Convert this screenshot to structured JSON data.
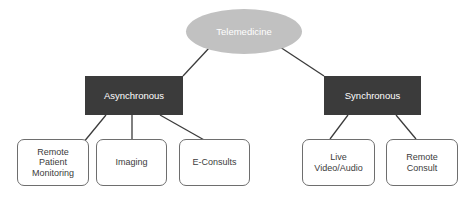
{
  "diagram": {
    "type": "hierarchy-tree",
    "title": "Telemedicine",
    "background_color": "#ffffff",
    "colors": {
      "root_fill": "#c1c1c1",
      "root_text": "#ffffff",
      "category_fill": "#3b3b3b",
      "category_text": "#ffffff",
      "leaf_fill": "#ffffff",
      "leaf_border": "#6e6e6e",
      "leaf_text": "#3c3c3c",
      "connector": "#3b3b3b"
    },
    "root": {
      "label": "Telemedicine",
      "shape": "ellipse"
    },
    "categories": [
      {
        "id": "asynchronous",
        "label": "Asynchronous",
        "shape": "rectangle",
        "children": [
          {
            "id": "remote-patient-monitoring",
            "label": "Remote\nPatient\nMonitoring"
          },
          {
            "id": "imaging",
            "label": "Imaging"
          },
          {
            "id": "e-consults",
            "label": "E-Consults"
          }
        ]
      },
      {
        "id": "synchronous",
        "label": "Synchronous",
        "shape": "rectangle",
        "children": [
          {
            "id": "live-video-audio",
            "label": "Live\nVideo/Audio"
          },
          {
            "id": "remote-consult",
            "label": "Remote\nConsult"
          }
        ]
      }
    ]
  }
}
